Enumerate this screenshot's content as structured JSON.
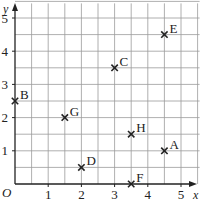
{
  "chart_data": {
    "type": "scatter",
    "title": "",
    "xlabel": "x",
    "ylabel": "y",
    "origin_label": "O",
    "xlim": [
      0,
      5.5
    ],
    "ylim": [
      0,
      5.5
    ],
    "grid": true,
    "grid_step": 0.5,
    "x_ticks": [
      1,
      2,
      3,
      4,
      5
    ],
    "y_ticks": [
      1,
      2,
      3,
      4,
      5
    ],
    "marker": "cross",
    "points": [
      {
        "label": "A",
        "x": 4.5,
        "y": 1
      },
      {
        "label": "B",
        "x": 0,
        "y": 2.5
      },
      {
        "label": "C",
        "x": 3,
        "y": 3.5
      },
      {
        "label": "D",
        "x": 2,
        "y": 0.5
      },
      {
        "label": "E",
        "x": 4.5,
        "y": 4.5
      },
      {
        "label": "F",
        "x": 3.5,
        "y": 0
      },
      {
        "label": "G",
        "x": 1.5,
        "y": 2
      },
      {
        "label": "H",
        "x": 3.5,
        "y": 1.5
      }
    ]
  }
}
